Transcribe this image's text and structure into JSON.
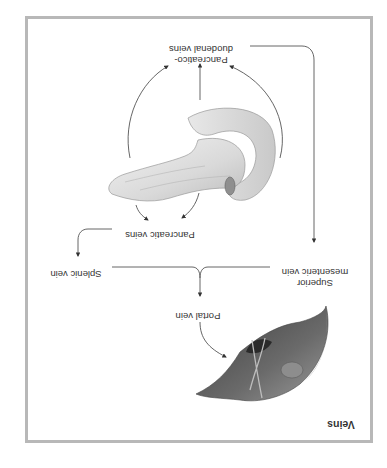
{
  "figure": {
    "title": "Veins",
    "orientation": "rotated 180 degrees",
    "frame_color": "#b8b8b8",
    "text_color": "#333333"
  },
  "labels": {
    "pancreaticoduodenal_line1": "Pancreatico-",
    "pancreaticoduodenal_line2": "duodenal veins",
    "pancreatic": "Pancreatic veins",
    "splenic": "Splenic vein",
    "sup_mesenteric_line1": "Superior",
    "sup_mesenteric_line2": "mesenteric vein",
    "portal": "Portal vein"
  },
  "organs": {
    "pancreas": "pancreas-illustration",
    "liver": "liver-illustration"
  },
  "flow": [
    {
      "from": "Pancreas",
      "to": "Pancreatico-duodenal veins"
    },
    {
      "from": "Pancreas",
      "to": "Pancreatic veins"
    },
    {
      "from": "Pancreatico-duodenal veins",
      "to": "Superior mesenteric vein"
    },
    {
      "from": "Pancreatic veins",
      "to": "Splenic vein"
    },
    {
      "from": "Splenic vein",
      "to": "Portal vein"
    },
    {
      "from": "Superior mesenteric vein",
      "to": "Portal vein"
    },
    {
      "from": "Portal vein",
      "to": "Liver"
    }
  ]
}
